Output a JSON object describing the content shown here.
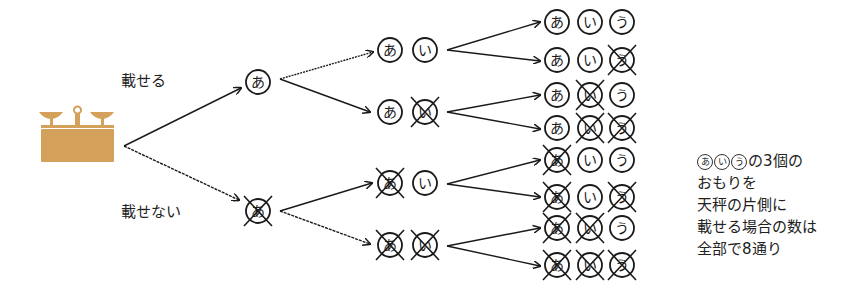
{
  "labels": {
    "place": "載せる",
    "not_place": "載せない"
  },
  "weights": [
    "あ",
    "い",
    "う"
  ],
  "tree": {
    "root": {
      "icon": "balance-scale-icon",
      "color": "#D4A15A"
    },
    "level1": [
      {
        "nodes": [
          {
            "char": "あ",
            "crossed": false
          }
        ]
      },
      {
        "nodes": [
          {
            "char": "あ",
            "crossed": true
          }
        ]
      }
    ],
    "level2": [
      {
        "nodes": [
          {
            "char": "あ",
            "crossed": false
          },
          {
            "char": "い",
            "crossed": false
          }
        ]
      },
      {
        "nodes": [
          {
            "char": "あ",
            "crossed": false
          },
          {
            "char": "い",
            "crossed": true
          }
        ]
      },
      {
        "nodes": [
          {
            "char": "あ",
            "crossed": true
          },
          {
            "char": "い",
            "crossed": false
          }
        ]
      },
      {
        "nodes": [
          {
            "char": "あ",
            "crossed": true
          },
          {
            "char": "い",
            "crossed": true
          }
        ]
      }
    ],
    "level3": [
      {
        "nodes": [
          {
            "char": "あ",
            "crossed": false
          },
          {
            "char": "い",
            "crossed": false
          },
          {
            "char": "う",
            "crossed": false
          }
        ]
      },
      {
        "nodes": [
          {
            "char": "あ",
            "crossed": false
          },
          {
            "char": "い",
            "crossed": false
          },
          {
            "char": "う",
            "crossed": true
          }
        ]
      },
      {
        "nodes": [
          {
            "char": "あ",
            "crossed": false
          },
          {
            "char": "い",
            "crossed": true
          },
          {
            "char": "う",
            "crossed": false
          }
        ]
      },
      {
        "nodes": [
          {
            "char": "あ",
            "crossed": false
          },
          {
            "char": "い",
            "crossed": true
          },
          {
            "char": "う",
            "crossed": true
          }
        ]
      },
      {
        "nodes": [
          {
            "char": "あ",
            "crossed": true
          },
          {
            "char": "い",
            "crossed": false
          },
          {
            "char": "う",
            "crossed": false
          }
        ]
      },
      {
        "nodes": [
          {
            "char": "あ",
            "crossed": true
          },
          {
            "char": "い",
            "crossed": false
          },
          {
            "char": "う",
            "crossed": true
          }
        ]
      },
      {
        "nodes": [
          {
            "char": "あ",
            "crossed": true
          },
          {
            "char": "い",
            "crossed": true
          },
          {
            "char": "う",
            "crossed": false
          }
        ]
      },
      {
        "nodes": [
          {
            "char": "あ",
            "crossed": true
          },
          {
            "char": "い",
            "crossed": true
          },
          {
            "char": "う",
            "crossed": true
          }
        ]
      }
    ]
  },
  "note": {
    "mini_weights": [
      "あ",
      "い",
      "う"
    ],
    "line1_suffix": "の3個の",
    "line2": "おもりを",
    "line3": "天秤の片側に",
    "line4": "載せる場合の数は",
    "line5": "全部で8通り"
  }
}
